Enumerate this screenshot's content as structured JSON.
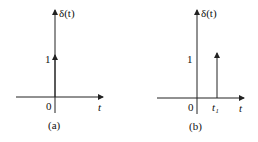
{
  "panels": [
    {
      "id": "a",
      "caption": "(a)",
      "y_label": "δ(t)",
      "x_label": "t",
      "origin_label": "0",
      "impulse_height_label": "1",
      "impulse_position_label": ""
    },
    {
      "id": "b",
      "caption": "(b)",
      "y_label": "δ(t)",
      "x_label": "t",
      "origin_label": "0",
      "impulse_height_label": "1",
      "impulse_position_label": "t₁"
    }
  ],
  "colors": {
    "line": "#222222",
    "text": "#111111",
    "background": "#ffffff"
  }
}
